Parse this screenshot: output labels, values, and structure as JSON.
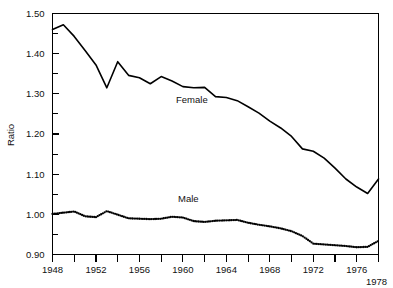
{
  "chart_data": {
    "type": "line",
    "title": "",
    "xlabel": "",
    "ylabel": "Ratio",
    "xlim": [
      1948,
      1978
    ],
    "ylim": [
      0.9,
      1.5
    ],
    "grid": false,
    "legend_position": "inline-annotation",
    "y_tick_labels": [
      "1.50",
      "1.40",
      "1.30",
      "1.20",
      "1.10",
      "1.00",
      "0.90"
    ],
    "y_tick_values": [
      1.5,
      1.4,
      1.3,
      1.2,
      1.1,
      1.0,
      0.9
    ],
    "y_minor_tick_values": [
      1.45,
      1.35,
      1.25,
      1.15,
      1.05,
      0.95
    ],
    "x_tick_values": [
      1948,
      1950,
      1952,
      1954,
      1956,
      1958,
      1960,
      1962,
      1964,
      1966,
      1968,
      1970,
      1972,
      1974,
      1976,
      1978
    ],
    "x_tick_labels": [
      "1948",
      "1952",
      "1956",
      "1960",
      "1964",
      "1968",
      "1972",
      "1976"
    ],
    "x_tick_label_values": [
      1948,
      1952,
      1956,
      1960,
      1964,
      1968,
      1972,
      1976
    ],
    "x_end_label": "1978",
    "x": [
      1948,
      1949,
      1950,
      1951,
      1952,
      1953,
      1954,
      1955,
      1956,
      1957,
      1958,
      1959,
      1960,
      1961,
      1962,
      1963,
      1964,
      1965,
      1966,
      1967,
      1968,
      1969,
      1970,
      1971,
      1972,
      1973,
      1974,
      1975,
      1976,
      1977,
      1978
    ],
    "series": [
      {
        "name": "Female",
        "style": "solid",
        "annotation": "Female",
        "values": [
          1.46,
          1.472,
          1.443,
          1.408,
          1.372,
          1.315,
          1.38,
          1.346,
          1.34,
          1.325,
          1.343,
          1.332,
          1.318,
          1.315,
          1.316,
          1.293,
          1.291,
          1.283,
          1.268,
          1.252,
          1.232,
          1.215,
          1.194,
          1.163,
          1.157,
          1.14,
          1.115,
          1.088,
          1.068,
          1.052,
          1.088
        ]
      },
      {
        "name": "Male",
        "style": "dotted",
        "annotation": "Male",
        "values": [
          1.001,
          1.004,
          1.007,
          0.995,
          0.993,
          1.008,
          0.999,
          0.99,
          0.989,
          0.988,
          0.989,
          0.994,
          0.992,
          0.983,
          0.981,
          0.984,
          0.985,
          0.986,
          0.979,
          0.974,
          0.97,
          0.965,
          0.958,
          0.946,
          0.927,
          0.925,
          0.923,
          0.921,
          0.918,
          0.919,
          0.934
        ]
      }
    ]
  },
  "annotations": {
    "female_label": "Female",
    "male_label": "Male"
  },
  "axes": {
    "y_axis_title": "Ratio"
  }
}
